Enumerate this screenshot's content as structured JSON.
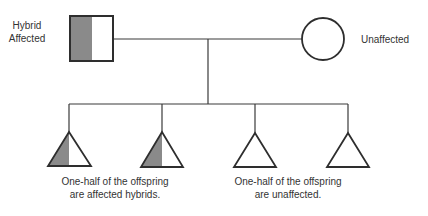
{
  "colors": {
    "line": "#3a3a3a",
    "affected_fill": "#8a8a8a",
    "background": "#ffffff"
  },
  "parents": {
    "father": {
      "symbol": "square",
      "status": "half-shaded",
      "label_lines": [
        "Hybrid",
        "Affected"
      ]
    },
    "mother": {
      "symbol": "circle",
      "status": "unshaded",
      "label": "Unaffected"
    }
  },
  "offspring": [
    {
      "symbol": "triangle",
      "status": "half-shaded"
    },
    {
      "symbol": "triangle",
      "status": "half-shaded"
    },
    {
      "symbol": "triangle",
      "status": "unshaded"
    },
    {
      "symbol": "triangle",
      "status": "unshaded"
    }
  ],
  "captions": {
    "affected": [
      "One-half of the offspring",
      "are affected hybrids."
    ],
    "unaffected": [
      "One-half of the offspring",
      "are unaffected."
    ]
  }
}
